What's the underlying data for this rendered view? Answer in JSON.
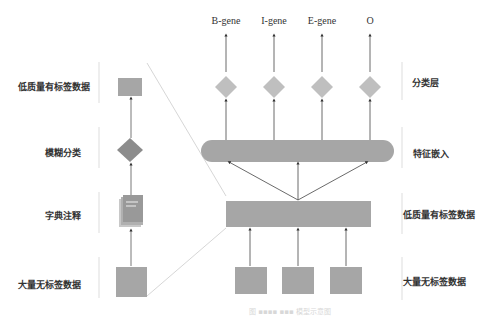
{
  "left_panel": {
    "labels": [
      "低质量有标签数据",
      "模糊分类",
      "字典注释",
      "大量无标签数据"
    ]
  },
  "right_panel": {
    "outputs": [
      "B-gene",
      "I-gene",
      "E-gene",
      "O"
    ],
    "layer_labels": [
      "分类层",
      "特征嵌入",
      "低质量有标签数据",
      "大量无标签数据"
    ]
  },
  "caption": "图 ▪▪▪▪ ▪▪▪ 模型示意图",
  "colors": {
    "box": "#a6a6a6",
    "diamond": "#bfbfbf",
    "dark_diamond": "#8c8c8c",
    "line": "#555555"
  }
}
